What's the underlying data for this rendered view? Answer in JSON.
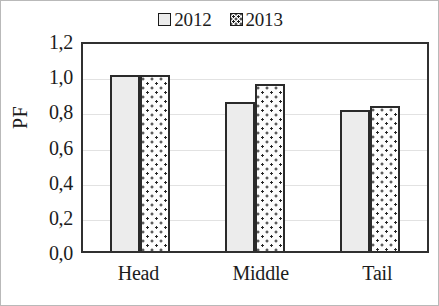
{
  "chart_data": {
    "type": "bar",
    "title": "",
    "xlabel": "",
    "ylabel": "PF",
    "categories": [
      "Head",
      "Middle",
      "Tail"
    ],
    "series": [
      {
        "name": "2012",
        "values": [
          1.0,
          0.85,
          0.8
        ],
        "swatch": "empty-square-icon",
        "fill": "#ececec"
      },
      {
        "name": "2013",
        "values": [
          1.0,
          0.95,
          0.825
        ],
        "swatch": "dotted-square-icon",
        "fill": "#ffffff"
      }
    ],
    "ylim": [
      0.0,
      1.2
    ],
    "ytick_values": [
      1.2,
      1.0,
      0.8,
      0.6,
      0.4,
      0.2,
      0.0
    ],
    "ytick_labels": [
      "1,2",
      "1,0",
      "0,8",
      "0,6",
      "0,4",
      "0,2",
      "0,0"
    ],
    "grid": true,
    "legend_position": "top-center",
    "decimal_separator": ","
  },
  "legend": {
    "entries": [
      {
        "label": "2012"
      },
      {
        "label": "2013"
      }
    ]
  },
  "axes": {
    "y_title": "PF",
    "y_ticks": [
      "1,2",
      "1,0",
      "0,8",
      "0,6",
      "0,4",
      "0,2",
      "0,0"
    ],
    "x_ticks": [
      "Head",
      "Middle",
      "Tail"
    ]
  },
  "colors": {
    "series_2012_fill": "#ececec",
    "series_2013_fill": "#ffffff",
    "bar_outline": "#2a2a2a",
    "plot_border": "#303030",
    "gridline": "#e2e2e2",
    "text": "#1c1c1c",
    "figure_border": "#b9b9b9"
  }
}
